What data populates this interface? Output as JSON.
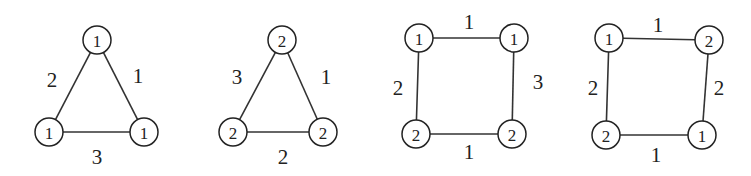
{
  "graphs": [
    {
      "id": "triangle-1",
      "nodes": [
        {
          "label": "1",
          "x": 97,
          "y": 40
        },
        {
          "label": "1",
          "x": 49,
          "y": 132
        },
        {
          "label": "1",
          "x": 144,
          "y": 132
        }
      ],
      "edges": [
        {
          "from": 0,
          "to": 1,
          "weight": "2",
          "lx": 52,
          "ly": 80
        },
        {
          "from": 0,
          "to": 2,
          "weight": "1",
          "lx": 138,
          "ly": 76
        },
        {
          "from": 1,
          "to": 2,
          "weight": "3",
          "lx": 97,
          "ly": 157
        }
      ]
    },
    {
      "id": "triangle-2",
      "nodes": [
        {
          "label": "2",
          "x": 282,
          "y": 40
        },
        {
          "label": "2",
          "x": 233,
          "y": 132
        },
        {
          "label": "2",
          "x": 323,
          "y": 132
        }
      ],
      "edges": [
        {
          "from": 0,
          "to": 1,
          "weight": "3",
          "lx": 237,
          "ly": 77
        },
        {
          "from": 0,
          "to": 2,
          "weight": "1",
          "lx": 326,
          "ly": 77
        },
        {
          "from": 1,
          "to": 2,
          "weight": "2",
          "lx": 283,
          "ly": 157
        }
      ]
    },
    {
      "id": "square-1",
      "nodes": [
        {
          "label": "1",
          "x": 419,
          "y": 38
        },
        {
          "label": "1",
          "x": 514,
          "y": 38
        },
        {
          "label": "2",
          "x": 416,
          "y": 134
        },
        {
          "label": "2",
          "x": 512,
          "y": 134
        }
      ],
      "edges": [
        {
          "from": 0,
          "to": 1,
          "weight": "1",
          "lx": 469,
          "ly": 22
        },
        {
          "from": 0,
          "to": 2,
          "weight": "2",
          "lx": 398,
          "ly": 88
        },
        {
          "from": 1,
          "to": 3,
          "weight": "3",
          "lx": 538,
          "ly": 82
        },
        {
          "from": 2,
          "to": 3,
          "weight": "1",
          "lx": 469,
          "ly": 152
        }
      ]
    },
    {
      "id": "square-2",
      "nodes": [
        {
          "label": "1",
          "x": 609,
          "y": 38
        },
        {
          "label": "2",
          "x": 709,
          "y": 40
        },
        {
          "label": "2",
          "x": 606,
          "y": 135
        },
        {
          "label": "1",
          "x": 702,
          "y": 135
        }
      ],
      "edges": [
        {
          "from": 0,
          "to": 1,
          "weight": "1",
          "lx": 658,
          "ly": 25
        },
        {
          "from": 0,
          "to": 2,
          "weight": "2",
          "lx": 593,
          "ly": 88
        },
        {
          "from": 1,
          "to": 3,
          "weight": "2",
          "lx": 719,
          "ly": 88
        },
        {
          "from": 2,
          "to": 3,
          "weight": "1",
          "lx": 656,
          "ly": 155
        }
      ]
    }
  ],
  "node_radius": 14
}
